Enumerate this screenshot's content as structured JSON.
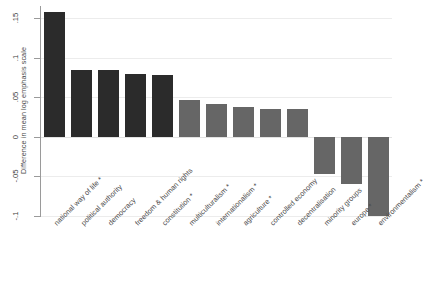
{
  "chart_data": {
    "type": "bar",
    "title": "",
    "xlabel": "",
    "ylabel": "Difference in mean log emphasis scale",
    "ylim": [
      -0.1,
      0.165
    ],
    "yticks": [
      0.15,
      0.1,
      0.05,
      0,
      -0.05,
      -0.1
    ],
    "ytick_labels": [
      ".15",
      ".1",
      ".05",
      "0",
      "-.05",
      "-.1"
    ],
    "grid": true,
    "legend": "none",
    "categories": [
      "national way of life *",
      "political authority",
      "democracy",
      "freedom & human rights",
      "constitution *",
      "multiculturalism *",
      "internationalism *",
      "agriculture *",
      "controlled economy",
      "decentralisation",
      "minority groups",
      "europe *",
      "environmentalism *"
    ],
    "values": [
      0.157,
      0.0845,
      0.0845,
      0.079,
      0.0785,
      0.0465,
      0.041,
      0.038,
      0.0355,
      0.0345,
      -0.0475,
      -0.059,
      -0.0995
    ],
    "bar_colors": [
      "#2b2b2b",
      "#2b2b2b",
      "#2b2b2b",
      "#2b2b2b",
      "#2b2b2b",
      "#666666",
      "#666666",
      "#666666",
      "#666666",
      "#666666",
      "#666666",
      "#666666",
      "#666666"
    ],
    "colors": {
      "dark": "#2b2b2b",
      "gray": "#666666",
      "axis": "#9a9a9a",
      "grid": "#ececec",
      "text": "#3c3c3c",
      "background": "#ffffff"
    }
  }
}
